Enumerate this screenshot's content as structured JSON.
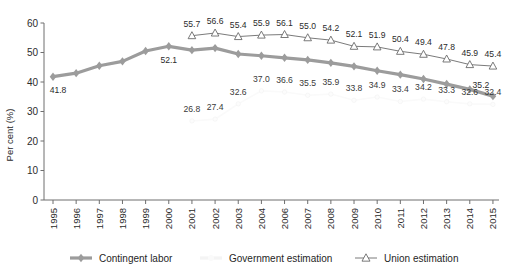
{
  "chart_data": {
    "type": "line",
    "title": "",
    "xlabel": "",
    "ylabel": "Per cent (%)",
    "ylim": [
      0,
      60
    ],
    "yticks": [
      0,
      10,
      20,
      30,
      40,
      50,
      60
    ],
    "grid": false,
    "legend_position": "bottom",
    "categories": [
      "1995",
      "1996",
      "1997",
      "1998",
      "1999",
      "2000",
      "2001",
      "2002",
      "2003",
      "2004",
      "2006",
      "2007",
      "2008",
      "2009",
      "2010",
      "2011",
      "2012",
      "2013",
      "2014",
      "2015"
    ],
    "series": [
      {
        "name": "Contingent labor",
        "marker": "diamond",
        "color": "#9c9c9c",
        "values": [
          41.8,
          43.0,
          45.5,
          47.0,
          50.5,
          52.1,
          50.8,
          51.5,
          49.5,
          48.9,
          48.2,
          47.5,
          46.5,
          45.3,
          43.8,
          42.5,
          41.0,
          39.3,
          37.5,
          35.2
        ],
        "labels": [
          "41.8",
          "",
          "",
          "",
          "",
          "52.1",
          "",
          "",
          "",
          "",
          "",
          "",
          "",
          "",
          "",
          "",
          "",
          "",
          "",
          "35.2"
        ]
      },
      {
        "name": "Government estimation",
        "marker": "none",
        "color": "#fafafa",
        "values": [
          null,
          null,
          null,
          null,
          null,
          null,
          26.8,
          27.4,
          32.6,
          37.0,
          36.6,
          35.5,
          35.9,
          33.8,
          34.9,
          33.4,
          34.2,
          33.3,
          32.6,
          32.4
        ],
        "labels": [
          "",
          "",
          "",
          "",
          "",
          "",
          "26.8",
          "27.4",
          "32.6",
          "37.0",
          "36.6",
          "35.5",
          "35.9",
          "33.8",
          "34.9",
          "33.4",
          "34.2",
          "33.3",
          "32.6",
          "32.4"
        ]
      },
      {
        "name": "Union estimation",
        "marker": "triangle",
        "color": "#6b6b6b",
        "values": [
          null,
          null,
          null,
          null,
          null,
          null,
          55.7,
          56.6,
          55.4,
          55.9,
          56.1,
          55.0,
          54.2,
          52.1,
          51.9,
          50.4,
          49.4,
          47.8,
          45.9,
          45.4
        ],
        "labels": [
          "",
          "",
          "",
          "",
          "",
          "",
          "55.7",
          "56.6",
          "55.4",
          "55.9",
          "56.1",
          "55.0",
          "54.2",
          "52.1",
          "51.9",
          "50.4",
          "49.4",
          "47.8",
          "45.9",
          "45.4"
        ]
      }
    ]
  },
  "legend": {
    "items": [
      {
        "label": "Contingent labor",
        "marker": "diamond"
      },
      {
        "label": "Government estimation",
        "marker": "faint-line"
      },
      {
        "label": "Union estimation",
        "marker": "triangle"
      }
    ]
  }
}
